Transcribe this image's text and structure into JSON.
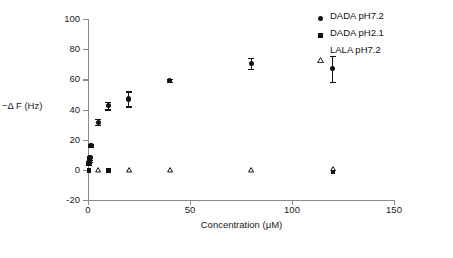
{
  "chart_data": {
    "type": "scatter",
    "title": "",
    "xlabel": "Concentration (μM)",
    "ylabel": "−Δ F (Hz)",
    "xlim": [
      0,
      150
    ],
    "ylim": [
      -20,
      100
    ],
    "xticks": [
      0,
      50,
      100,
      150
    ],
    "yticks": [
      -20,
      0,
      20,
      40,
      60,
      80,
      100
    ],
    "grid": false,
    "legend_position": "top-right",
    "series": [
      {
        "name": "DADA pH7.2",
        "marker": "filled-circle",
        "color": "#111111",
        "points": [
          {
            "x": 0.5,
            "y": 4.5,
            "yerr": 1.5
          },
          {
            "x": 0.8,
            "y": 6.5,
            "yerr": 1.5
          },
          {
            "x": 1.0,
            "y": 8.0,
            "yerr": 1.5
          },
          {
            "x": 1.5,
            "y": 16.2,
            "yerr": 1.0
          },
          {
            "x": 5.0,
            "y": 31.5,
            "yerr": 2.0
          },
          {
            "x": 10.0,
            "y": 42.5,
            "yerr": 2.5
          },
          {
            "x": 20.0,
            "y": 47.0,
            "yerr": 5.0
          },
          {
            "x": 40.0,
            "y": 59.0,
            "yerr": 1.0
          },
          {
            "x": 80.0,
            "y": 70.5,
            "yerr": 3.5
          },
          {
            "x": 120.0,
            "y": 67.0,
            "yerr": 8.5
          }
        ]
      },
      {
        "name": "DADA pH2.1",
        "marker": "filled-square",
        "color": "#111111",
        "points": [
          {
            "x": 0.5,
            "y": -0.5,
            "yerr": 0
          },
          {
            "x": 10.0,
            "y": -0.5,
            "yerr": 0
          },
          {
            "x": 120.0,
            "y": -1.5,
            "yerr": 0
          }
        ]
      },
      {
        "name": "LALA pH7.2",
        "marker": "open-triangle",
        "color": "#111111",
        "points": [
          {
            "x": 5.0,
            "y": 0.0,
            "yerr": 0
          },
          {
            "x": 20.0,
            "y": 0.0,
            "yerr": 0
          },
          {
            "x": 40.0,
            "y": 0.0,
            "yerr": 0
          },
          {
            "x": 80.0,
            "y": 0.0,
            "yerr": 0
          },
          {
            "x": 120.0,
            "y": 1.0,
            "yerr": 0
          }
        ]
      }
    ]
  },
  "axes": {
    "y_title": "−Δ F (Hz)",
    "x_title": "Concentration (μM)",
    "y_tick_labels": [
      "100",
      "80",
      "60",
      "40",
      "20",
      "0",
      "-20"
    ],
    "x_tick_labels": [
      "0",
      "50",
      "100",
      "150"
    ]
  },
  "legend": {
    "items": [
      {
        "label": "DADA pH7.2",
        "marker": "filled-circle"
      },
      {
        "label": "DADA pH2.1",
        "marker": "filled-square"
      },
      {
        "label": "LALA pH7.2",
        "marker": "open-triangle"
      }
    ]
  },
  "caption": {
    "text": ""
  }
}
